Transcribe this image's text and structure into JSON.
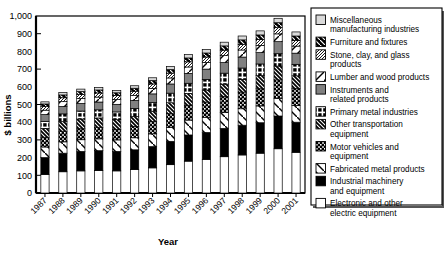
{
  "chart_data": {
    "type": "bar",
    "stacked": true,
    "title": "",
    "xlabel": "Year",
    "ylabel": "$ billions",
    "ylim": [
      0,
      1000
    ],
    "ytick_values": [
      0,
      100,
      200,
      300,
      400,
      500,
      600,
      700,
      800,
      900,
      1000
    ],
    "ytick_labels": [
      "0",
      "100",
      "200",
      "300",
      "400",
      "500",
      "600",
      "700",
      "800",
      "900",
      "1,000"
    ],
    "grid": false,
    "legend_position": "right",
    "categories": [
      "1987",
      "1988",
      "1989",
      "1990",
      "1991",
      "1992",
      "1993",
      "1994",
      "1995",
      "1996",
      "1997",
      "1998",
      "1999",
      "2000",
      "2001"
    ],
    "series": [
      {
        "name": "Electronic and other electric equipment",
        "pattern": "white",
        "values": [
          105,
          120,
          125,
          127,
          125,
          132,
          142,
          160,
          180,
          190,
          205,
          215,
          225,
          250,
          230
        ]
      },
      {
        "name": "Industrial machinery and equipment",
        "pattern": "black",
        "values": [
          95,
          105,
          110,
          112,
          110,
          112,
          120,
          132,
          148,
          152,
          160,
          168,
          172,
          185,
          170
        ]
      },
      {
        "name": "Fabricated metal products",
        "pattern": "diag-back-wide",
        "values": [
          60,
          64,
          66,
          67,
          65,
          68,
          72,
          78,
          84,
          86,
          90,
          93,
          95,
          100,
          94
        ]
      },
      {
        "name": "Motor vehicles and equipment",
        "pattern": "grid-dots",
        "values": [
          55,
          60,
          62,
          63,
          60,
          64,
          70,
          78,
          84,
          86,
          90,
          94,
          97,
          104,
          96
        ]
      },
      {
        "name": "Other transportation equipment",
        "pattern": "diag-fwd-dense",
        "values": [
          50,
          54,
          55,
          55,
          54,
          56,
          58,
          62,
          66,
          68,
          70,
          72,
          74,
          78,
          72
        ]
      },
      {
        "name": "Primary metal industries",
        "pattern": "cross-box",
        "values": [
          40,
          44,
          45,
          46,
          44,
          46,
          50,
          54,
          58,
          60,
          62,
          64,
          66,
          70,
          65
        ]
      },
      {
        "name": "Instruments and related products",
        "pattern": "gray",
        "values": [
          38,
          42,
          43,
          44,
          43,
          45,
          48,
          52,
          56,
          58,
          60,
          62,
          64,
          68,
          63
        ]
      },
      {
        "name": "Lumber and wood products",
        "pattern": "diag-fwd-white",
        "values": [
          25,
          27,
          28,
          28,
          27,
          29,
          31,
          34,
          36,
          38,
          39,
          40,
          41,
          44,
          40
        ]
      },
      {
        "name": "Stone, clay, and glass products",
        "pattern": "diag-fwd-thin",
        "values": [
          20,
          22,
          22,
          23,
          22,
          23,
          25,
          27,
          29,
          30,
          31,
          32,
          33,
          35,
          32
        ]
      },
      {
        "name": "Furniture and fixtures",
        "pattern": "diag-back-black",
        "values": [
          15,
          16,
          17,
          17,
          16,
          17,
          19,
          20,
          22,
          23,
          24,
          25,
          26,
          28,
          25
        ]
      },
      {
        "name": "Miscellaneous manufacturing industries",
        "pattern": "light-gray",
        "values": [
          12,
          13,
          14,
          14,
          13,
          14,
          16,
          18,
          19,
          20,
          21,
          22,
          23,
          25,
          23
        ]
      }
    ],
    "totals": [
      515,
      567,
      587,
      596,
      579,
      606,
      651,
      715,
      782,
      811,
      852,
      887,
      916,
      987,
      910
    ]
  },
  "legend": {
    "items": [
      {
        "label": "Miscellaneous manufacturing industries",
        "pattern": "light-gray"
      },
      {
        "label": "Furniture and fixtures",
        "pattern": "diag-back-black"
      },
      {
        "label": "Stone, clay, and glass products",
        "pattern": "diag-fwd-thin"
      },
      {
        "label": "Lumber and wood products",
        "pattern": "diag-fwd-white"
      },
      {
        "label": "Instruments and related products",
        "pattern": "gray"
      },
      {
        "label": "Primary metal industries",
        "pattern": "cross-box"
      },
      {
        "label": "Other transportation equipment",
        "pattern": "diag-fwd-dense"
      },
      {
        "label": "Motor vehicles and equipment",
        "pattern": "grid-dots"
      },
      {
        "label": "Fabricated metal products",
        "pattern": "diag-back-wide"
      },
      {
        "label": "Industrial machinery and equipment",
        "pattern": "black"
      },
      {
        "label": "Electronic and other electric equipment",
        "pattern": "white"
      }
    ]
  },
  "colors": {
    "axis": "#000000",
    "background": "#ffffff",
    "gray_fill": "#808080",
    "light_gray_fill": "#d9d9d9",
    "black_fill": "#000000",
    "white_fill": "#ffffff"
  }
}
